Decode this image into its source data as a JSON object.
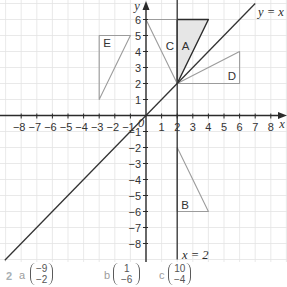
{
  "diagram": {
    "type": "coordinate-grid",
    "grid": true,
    "x_label": "x",
    "y_label": "y",
    "origin_label": "0",
    "x_range": [
      -8,
      8
    ],
    "y_range": [
      -8,
      6
    ],
    "x_ticks": [
      -8,
      -7,
      -6,
      -5,
      -4,
      -3,
      -2,
      -1,
      1,
      2,
      3,
      4,
      5,
      6,
      7,
      8
    ],
    "x_tick_labels": [
      "−8",
      "−7",
      "−6",
      "−5",
      "−4",
      "−3",
      "−2",
      "−1",
      "1",
      "2",
      "3",
      "4",
      "5",
      "6",
      "7",
      "8"
    ],
    "y_ticks": [
      6,
      5,
      4,
      3,
      2,
      1,
      -1,
      -2,
      -3,
      -4,
      -5,
      -6,
      -7,
      -8
    ],
    "y_tick_labels": [
      "6",
      "5",
      "4",
      "3",
      "2",
      "1",
      "−1",
      "−2",
      "−3",
      "−4",
      "−5",
      "−6",
      "−7",
      "−8"
    ],
    "lines": [
      {
        "name": "line-y-equals-x",
        "label": "y = x",
        "from": [
          -9.05,
          -9.05
        ],
        "to": [
          7.0,
          7.0
        ],
        "label_at": [
          7.18,
          6.47
        ]
      },
      {
        "name": "line-x-equals-2",
        "label": "x = 2",
        "from": [
          2,
          7.25
        ],
        "to": [
          2,
          -9.0
        ],
        "label_at": [
          2.31,
          -8.72
        ]
      }
    ],
    "triangles": [
      {
        "label": "A",
        "vertices": [
          [
            2,
            6
          ],
          [
            4,
            6
          ],
          [
            2,
            2
          ]
        ],
        "shaded": true,
        "outline": "dark",
        "label_at": [
          2.54,
          4.34
        ]
      },
      {
        "label": "B",
        "vertices": [
          [
            2,
            -2
          ],
          [
            2,
            -6
          ],
          [
            4,
            -6
          ]
        ],
        "shaded": false,
        "outline": "light",
        "label_at": [
          2.5,
          -5.6
        ]
      },
      {
        "label": "C",
        "vertices": [
          [
            0,
            6
          ],
          [
            2,
            6
          ],
          [
            2,
            2
          ]
        ],
        "shaded": false,
        "outline": "light",
        "label_at": [
          1.54,
          4.34
        ]
      },
      {
        "label": "D",
        "vertices": [
          [
            2,
            2
          ],
          [
            6,
            2
          ],
          [
            6,
            4
          ]
        ],
        "shaded": false,
        "outline": "light",
        "label_at": [
          5.51,
          2.47
        ]
      },
      {
        "label": "E",
        "vertices": [
          [
            -3,
            5
          ],
          [
            -1,
            5
          ],
          [
            -3,
            1
          ]
        ],
        "shaded": false,
        "outline": "light",
        "label_at": [
          -2.5,
          4.53
        ]
      }
    ],
    "colors": {
      "grid": "#e3e3e3",
      "axis": "#2b2b2b",
      "dark_outline": "#2b2b2b",
      "light_outline": "#9c9c9c",
      "shade": "#e6e6e6",
      "line": "#333333"
    }
  },
  "answers": {
    "question_number": "2",
    "items": [
      {
        "letter": "a",
        "vector": [
          "−9",
          "−2"
        ]
      },
      {
        "letter": "b",
        "vector": [
          "1",
          "−6"
        ]
      },
      {
        "letter": "c",
        "vector": [
          "10",
          "−4"
        ]
      }
    ]
  }
}
